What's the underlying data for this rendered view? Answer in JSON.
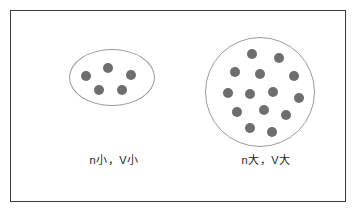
{
  "figure": {
    "border_color": "#3b3b3b",
    "background_color": "#ffffff",
    "container_outline_color": "#9a9a9a",
    "dot_color": "#6e6e6e"
  },
  "panels": [
    {
      "id": "small",
      "container_shape": "ellipse",
      "label": "n小，V小",
      "particle_count": 5,
      "particles": [
        {
          "x": 12,
          "y": 22
        },
        {
          "x": 34,
          "y": 14
        },
        {
          "x": 57,
          "y": 21
        },
        {
          "x": 25,
          "y": 36
        },
        {
          "x": 48,
          "y": 36
        }
      ]
    },
    {
      "id": "large",
      "container_shape": "circle",
      "label": "n大，V大",
      "particle_count": 14,
      "particles": [
        {
          "x": 42,
          "y": 12
        },
        {
          "x": 69,
          "y": 16
        },
        {
          "x": 25,
          "y": 30
        },
        {
          "x": 50,
          "y": 32
        },
        {
          "x": 84,
          "y": 34
        },
        {
          "x": 18,
          "y": 51
        },
        {
          "x": 40,
          "y": 52
        },
        {
          "x": 63,
          "y": 50
        },
        {
          "x": 89,
          "y": 56
        },
        {
          "x": 27,
          "y": 70
        },
        {
          "x": 54,
          "y": 68
        },
        {
          "x": 76,
          "y": 73
        },
        {
          "x": 40,
          "y": 86
        },
        {
          "x": 62,
          "y": 90
        }
      ]
    }
  ]
}
